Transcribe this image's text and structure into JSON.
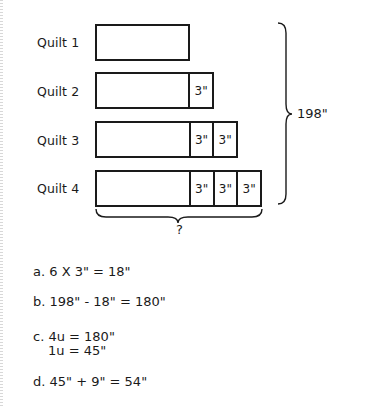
{
  "diagram": {
    "rows": [
      {
        "label": "Quilt 1",
        "units": []
      },
      {
        "label": "Quilt 2",
        "units": [
          "3\""
        ]
      },
      {
        "label": "Quilt 3",
        "units": [
          "3\"",
          "3\""
        ]
      },
      {
        "label": "Quilt 4",
        "units": [
          "3\"",
          "3\"",
          "3\""
        ]
      }
    ],
    "total_label": "198\"",
    "unknown_label": "?"
  },
  "solution": {
    "a": "a. 6 X 3\" = 18\"",
    "b": "b. 198\" - 18\" = 180\"",
    "c1": "c. 4u = 180\"",
    "c2": "1u = 45\"",
    "d": "d. 45\" + 9\" = 54\""
  }
}
